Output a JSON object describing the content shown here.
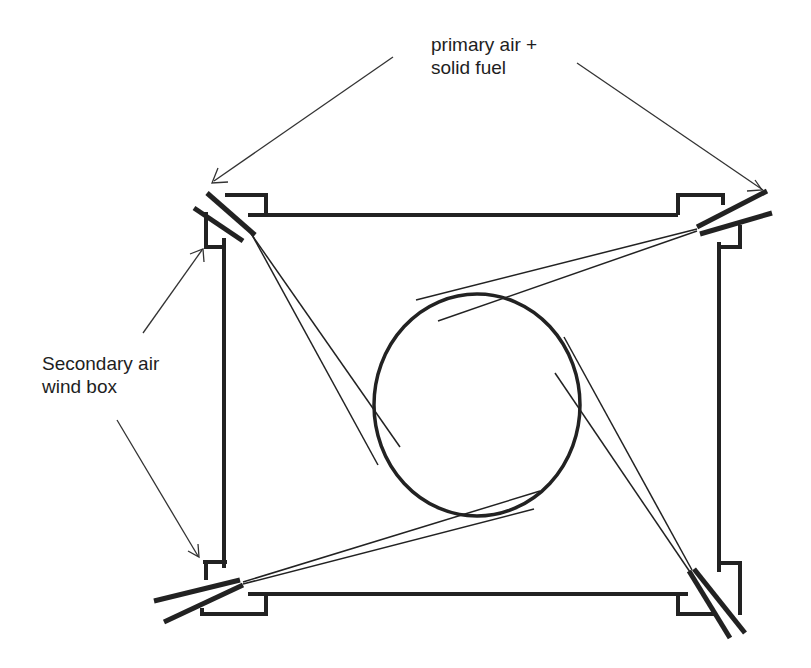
{
  "diagram": {
    "type": "tangential-firing-furnace-cross-section",
    "labels": {
      "primary": [
        "primary air +",
        "solid fuel"
      ],
      "secondary": [
        "Secondary air",
        "wind box"
      ]
    },
    "components": {
      "furnace_walls": "square furnace cross-section",
      "fireball": "central swirling circle",
      "burners": [
        "top-left",
        "top-right",
        "bottom-left",
        "bottom-right"
      ],
      "wind_boxes": [
        "top-left",
        "top-right",
        "bottom-left",
        "bottom-right"
      ]
    },
    "colors": {
      "stroke": "#222222",
      "text": "#1e1e1e",
      "background": "#ffffff"
    }
  }
}
